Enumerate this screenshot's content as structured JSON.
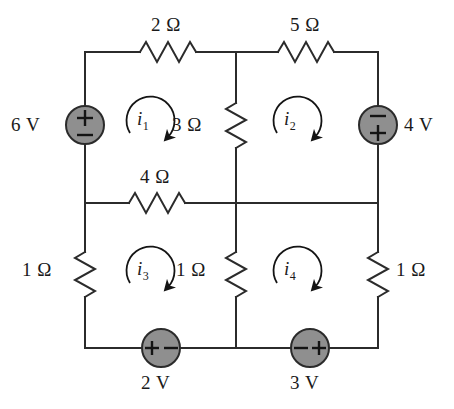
{
  "figure": {
    "kind": "circuit-schematic",
    "background_color": "#ffffff",
    "wire_color": "#2b2b2b",
    "source_fill_color": "#8f8f8f",
    "source_stroke_color": "#2b2b2b",
    "text_color": "#1a1a1a"
  },
  "resistors": [
    {
      "id": "r-top-left",
      "label": "2 Ω",
      "orientation": "horizontal",
      "branch": "top-left"
    },
    {
      "id": "r-top-right",
      "label": "5 Ω",
      "orientation": "horizontal",
      "branch": "top-right"
    },
    {
      "id": "r-center-upper",
      "label": "3 Ω",
      "orientation": "vertical",
      "branch": "center-upper"
    },
    {
      "id": "r-middle",
      "label": "4 Ω",
      "orientation": "horizontal",
      "branch": "middle-left"
    },
    {
      "id": "r-left-lower",
      "label": "1 Ω",
      "orientation": "vertical",
      "branch": "left-lower"
    },
    {
      "id": "r-center-lower",
      "label": "1 Ω",
      "orientation": "vertical",
      "branch": "center-lower"
    },
    {
      "id": "r-right-lower",
      "label": "1 Ω",
      "orientation": "vertical",
      "branch": "right-lower"
    }
  ],
  "sources": [
    {
      "id": "src-6v",
      "label": "6 V",
      "orientation": "vertical",
      "plus": "top",
      "minus": "bottom",
      "branch": "left-upper"
    },
    {
      "id": "src-4v",
      "label": "4 V",
      "orientation": "vertical",
      "plus": "bottom",
      "minus": "top",
      "branch": "right-upper"
    },
    {
      "id": "src-2v",
      "label": "2 V",
      "orientation": "horizontal",
      "plus": "left",
      "minus": "right",
      "branch": "bottom-left"
    },
    {
      "id": "src-3v",
      "label": "3 V",
      "orientation": "horizontal",
      "plus": "right",
      "minus": "left",
      "branch": "bottom-right"
    }
  ],
  "mesh_currents": [
    {
      "id": "i1",
      "symbol": "i",
      "subscript": "1",
      "direction": "clockwise",
      "mesh": "top-left"
    },
    {
      "id": "i2",
      "symbol": "i",
      "subscript": "2",
      "direction": "clockwise",
      "mesh": "top-right"
    },
    {
      "id": "i3",
      "symbol": "i",
      "subscript": "3",
      "direction": "clockwise",
      "mesh": "bottom-left"
    },
    {
      "id": "i4",
      "symbol": "i",
      "subscript": "4",
      "direction": "clockwise",
      "mesh": "bottom-right"
    }
  ],
  "polarity_marks": {
    "plus": "+",
    "minus": "−"
  }
}
